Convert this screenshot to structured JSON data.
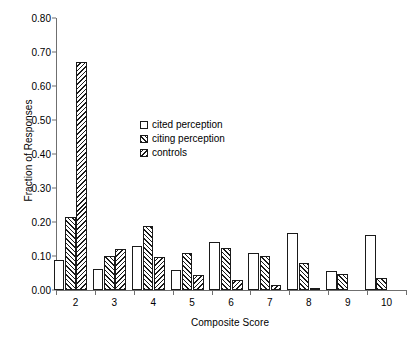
{
  "chart_data": {
    "type": "bar",
    "title": "",
    "xlabel": "Composite Score",
    "ylabel": "Fraction of Responses",
    "categories": [
      "2",
      "3",
      "4",
      "5",
      "6",
      "7",
      "8",
      "9",
      "10"
    ],
    "ylim": [
      0.0,
      0.8
    ],
    "yticks": [
      "0.00",
      "0.10",
      "0.20",
      "0.30",
      "0.40",
      "0.50",
      "0.60",
      "0.70",
      "0.80"
    ],
    "ytick_values": [
      0.0,
      0.1,
      0.2,
      0.3,
      0.4,
      0.5,
      0.6,
      0.7,
      0.8
    ],
    "grid": false,
    "legend_position": "upper-center-left",
    "series": [
      {
        "name": "cited perception",
        "fill": "open",
        "values": [
          0.088,
          0.063,
          0.128,
          0.06,
          0.14,
          0.11,
          0.168,
          0.055,
          0.162
        ]
      },
      {
        "name": "citing perception",
        "fill": "forward-hatch",
        "values": [
          0.215,
          0.1,
          0.187,
          0.108,
          0.125,
          0.1,
          0.08,
          0.046,
          0.035
        ]
      },
      {
        "name": "controls",
        "fill": "back-hatch",
        "values": [
          0.67,
          0.122,
          0.098,
          0.043,
          0.03,
          0.015,
          0.005,
          0.0,
          0.0
        ]
      }
    ]
  },
  "legend": {
    "items": [
      {
        "label": "cited perception"
      },
      {
        "label": "citing perception"
      },
      {
        "label": "controls"
      }
    ]
  },
  "colors": {
    "axis": "#6f6f6f",
    "bar_outline": "#1a1a1a",
    "background": "#ffffff"
  }
}
